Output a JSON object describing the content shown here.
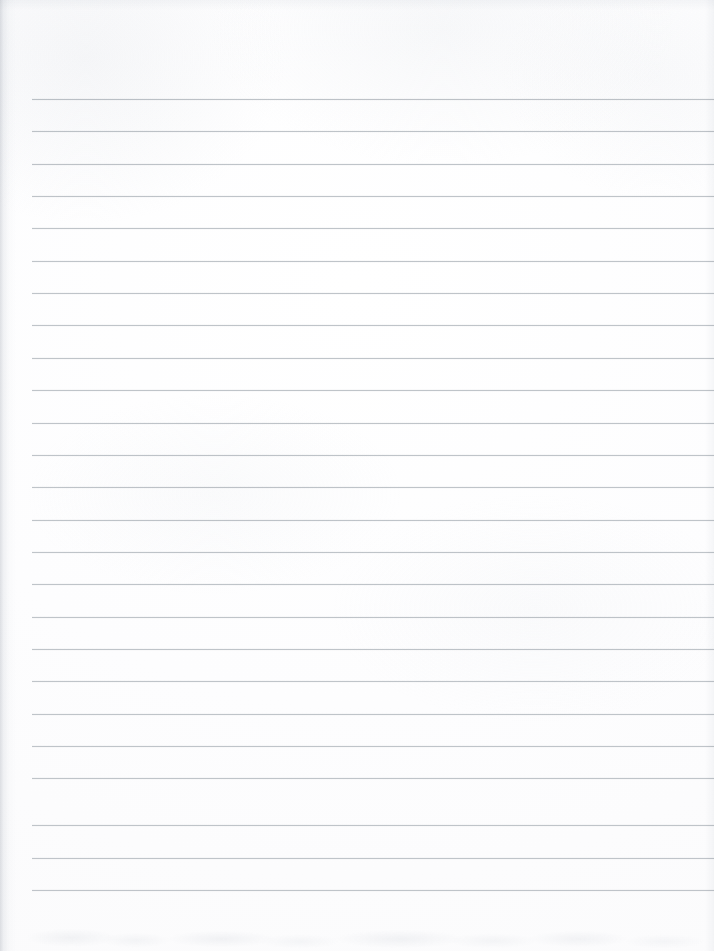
{
  "document": {
    "type": "scanned-lined-paper",
    "title": "Blank Ruled Notebook Page",
    "description": "Scan of an empty ruled notebook sheet with no handwriting, print or markings.",
    "page_width": 714,
    "page_height": 951,
    "background_color": "#fefefe",
    "text_content": "",
    "has_handwriting": false,
    "has_printed_text": false,
    "has_images": false
  },
  "ruling": {
    "line_color": "#b9bec4",
    "line_thickness": 1,
    "line_count": 25,
    "first_line_y": 99,
    "line_spacing": 32.3,
    "left_inset": 32,
    "right_inset": 0,
    "top_margin_height": 99,
    "bottom_margin_height": 61,
    "lines": [
      {
        "index": 1,
        "y": 99,
        "x_start": 32,
        "x_end": 714
      },
      {
        "index": 2,
        "y": 131,
        "x_start": 32,
        "x_end": 714
      },
      {
        "index": 3,
        "y": 164,
        "x_start": 32,
        "x_end": 714
      },
      {
        "index": 4,
        "y": 196,
        "x_start": 32,
        "x_end": 714
      },
      {
        "index": 5,
        "y": 228,
        "x_start": 32,
        "x_end": 714
      },
      {
        "index": 6,
        "y": 261,
        "x_start": 32,
        "x_end": 714
      },
      {
        "index": 7,
        "y": 293,
        "x_start": 32,
        "x_end": 714
      },
      {
        "index": 8,
        "y": 325,
        "x_start": 32,
        "x_end": 714
      },
      {
        "index": 9,
        "y": 358,
        "x_start": 32,
        "x_end": 714
      },
      {
        "index": 10,
        "y": 390,
        "x_start": 32,
        "x_end": 714
      },
      {
        "index": 11,
        "y": 423,
        "x_start": 32,
        "x_end": 714
      },
      {
        "index": 12,
        "y": 455,
        "x_start": 32,
        "x_end": 714
      },
      {
        "index": 13,
        "y": 487,
        "x_start": 32,
        "x_end": 714
      },
      {
        "index": 14,
        "y": 520,
        "x_start": 32,
        "x_end": 714
      },
      {
        "index": 15,
        "y": 552,
        "x_start": 32,
        "x_end": 714
      },
      {
        "index": 16,
        "y": 584,
        "x_start": 32,
        "x_end": 714
      },
      {
        "index": 17,
        "y": 617,
        "x_start": 32,
        "x_end": 714
      },
      {
        "index": 18,
        "y": 649,
        "x_start": 32,
        "x_end": 714
      },
      {
        "index": 19,
        "y": 681,
        "x_start": 32,
        "x_end": 714
      },
      {
        "index": 20,
        "y": 714,
        "x_start": 32,
        "x_end": 714
      },
      {
        "index": 21,
        "y": 746,
        "x_start": 32,
        "x_end": 714
      },
      {
        "index": 22,
        "y": 778,
        "x_start": 32,
        "x_end": 714
      },
      {
        "index": 23,
        "y": 825,
        "x_start": 32,
        "x_end": 714
      },
      {
        "index": 24,
        "y": 858,
        "x_start": 32,
        "x_end": 714
      },
      {
        "index": 25,
        "y": 890,
        "x_start": 32,
        "x_end": 714
      }
    ]
  },
  "scan_artifacts": {
    "left_edge_shadow": true,
    "top_edge_shadow": true,
    "right_edge_shadow": true,
    "bottom_noise_band": true,
    "paper_grain": true
  }
}
